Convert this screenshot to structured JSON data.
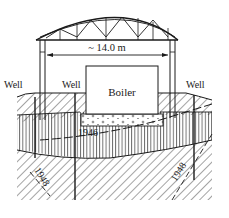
{
  "diagram": {
    "span_label": "~ 14.0 m",
    "boiler_label": "Boiler",
    "well_labels": [
      "Well",
      "Well",
      "Well"
    ],
    "contour_1946": "1946",
    "contour_1948_left": "1948",
    "contour_1948_right": "1948"
  },
  "colors": {
    "ink": "#1a1a1a",
    "background": "#ffffff"
  }
}
